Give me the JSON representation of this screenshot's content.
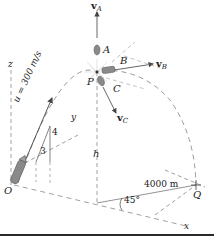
{
  "diagram": {
    "type": "projectile-3d-figure",
    "labels": {
      "vA": "v",
      "vA_sub": "A",
      "vB": "v",
      "vB_sub": "B",
      "vC": "v",
      "vC_sub": "C",
      "A": "A",
      "B": "B",
      "C": "C",
      "P": "P",
      "O": "O",
      "Q": "Q",
      "h": "h",
      "z": "z",
      "y": "y",
      "x": "x",
      "u": "u = 300 m/s",
      "slope_rise": "4",
      "slope_run": "3",
      "distance": "4000 m",
      "angle": "45°"
    },
    "colors": {
      "line": "#555555",
      "dash": "#888888",
      "fragment": "#8a8a8a",
      "text": "#222222",
      "rule": "#2a2a2a"
    }
  }
}
